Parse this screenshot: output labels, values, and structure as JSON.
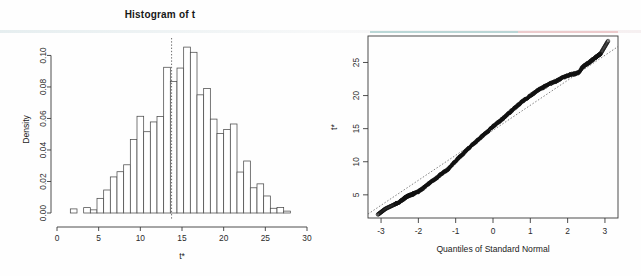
{
  "page": {
    "background": "#fefefe",
    "width": 641,
    "height": 276
  },
  "panels": {
    "histogram": {
      "title": "Histogram of t",
      "ylabel": "Density",
      "xlabel": "t*"
    },
    "qqplot": {
      "title": "",
      "ylabel": "t*",
      "xlabel": "Quantiles of Standard Normal"
    }
  },
  "colors": {
    "axis": "#3b3b3b",
    "bar_stroke": "#4a4a4a",
    "bar_fill": "#ffffff",
    "point": "#111111",
    "scan_teal": "#7fb8b5",
    "scan_pink": "#e2a3a6"
  },
  "chart_data": [
    {
      "type": "bar",
      "id": "histogram-of-t",
      "title": "Histogram of t",
      "xlabel": "t*",
      "ylabel": "Density",
      "xlim": [
        0,
        30
      ],
      "ylim": [
        0.0,
        0.106
      ],
      "xticks": [
        0,
        5,
        10,
        15,
        20,
        25,
        30
      ],
      "xtick_labels": [
        "0",
        "5",
        "10",
        "15",
        "20",
        "25",
        "30"
      ],
      "yticks": [
        0.0,
        0.02,
        0.04,
        0.06,
        0.08,
        0.1
      ],
      "ytick_labels": [
        "0.00",
        "0.02",
        "0.04",
        "0.06",
        "0.08",
        "0.10"
      ],
      "grid": false,
      "bin_width": 0.8,
      "bin_starts": [
        1.6,
        2.4,
        3.2,
        4.0,
        4.8,
        5.6,
        6.4,
        7.2,
        8.0,
        8.8,
        9.6,
        10.4,
        11.2,
        12.0,
        12.8,
        13.6,
        14.4,
        15.2,
        16.0,
        16.8,
        17.6,
        18.4,
        19.2,
        20.0,
        20.8,
        21.6,
        22.4,
        23.2,
        24.0,
        24.8,
        25.6,
        26.4,
        27.2,
        28.0
      ],
      "values": [
        0.0026,
        0.0,
        0.0034,
        0.002,
        0.0093,
        0.0146,
        0.0229,
        0.0262,
        0.0306,
        0.0466,
        0.0614,
        0.0516,
        0.0578,
        0.0612,
        0.0925,
        0.0835,
        0.092,
        0.1053,
        0.102,
        0.075,
        0.079,
        0.0596,
        0.0505,
        0.053,
        0.0565,
        0.026,
        0.033,
        0.016,
        0.0185,
        0.0108,
        0.003,
        0.0035,
        0.0012,
        0.0,
        0.0018
      ],
      "annotations": [
        {
          "type": "vertical-dashed-line",
          "x": 13.75,
          "label": "observed statistic"
        }
      ]
    },
    {
      "type": "scatter",
      "id": "normal-qq-plot",
      "title": "",
      "xlabel": "Quantiles of Standard Normal",
      "ylabel": "t*",
      "xlim": [
        -3.35,
        3.35
      ],
      "ylim": [
        1.5,
        29.0
      ],
      "xticks": [
        -3,
        -2,
        -1,
        0,
        1,
        2,
        3
      ],
      "xtick_labels": [
        "-3",
        "-2",
        "-1",
        "0",
        "1",
        "2",
        "3"
      ],
      "yticks": [
        5,
        10,
        15,
        20,
        25
      ],
      "ytick_labels": [
        "5",
        "10",
        "15",
        "20",
        "25"
      ],
      "grid": false,
      "frame": "box",
      "marker": "open-circle",
      "n_points": 1000,
      "reference_line": {
        "type": "qq-line",
        "x": [
          -3.35,
          3.35
        ],
        "y": [
          2.1,
          27.4
        ]
      },
      "points_xy": [
        [
          -3.09,
          2.0
        ],
        [
          -2.88,
          2.9
        ],
        [
          -2.62,
          3.6
        ],
        [
          -2.52,
          3.9
        ],
        [
          -2.45,
          4.1
        ],
        [
          -2.4,
          4.35
        ],
        [
          -2.35,
          4.6
        ],
        [
          -2.3,
          4.75
        ],
        [
          -2.25,
          4.9
        ],
        [
          -2.2,
          5.0
        ],
        [
          -2.15,
          5.1
        ],
        [
          -2.1,
          5.25
        ],
        [
          -2.0,
          5.5
        ],
        [
          -1.9,
          5.9
        ],
        [
          -1.8,
          6.3
        ],
        [
          -1.7,
          6.8
        ],
        [
          -1.6,
          7.2
        ],
        [
          -1.5,
          7.6
        ],
        [
          -1.4,
          8.1
        ],
        [
          -1.3,
          8.5
        ],
        [
          -1.2,
          8.9
        ],
        [
          -1.1,
          9.5
        ],
        [
          -1.0,
          10.1
        ],
        [
          -0.9,
          10.7
        ],
        [
          -0.8,
          11.2
        ],
        [
          -0.7,
          11.8
        ],
        [
          -0.6,
          12.3
        ],
        [
          -0.5,
          12.8
        ],
        [
          -0.4,
          13.3
        ],
        [
          -0.3,
          13.8
        ],
        [
          -0.2,
          14.3
        ],
        [
          -0.1,
          14.8
        ],
        [
          0.0,
          15.3
        ],
        [
          0.1,
          15.8
        ],
        [
          0.2,
          16.2
        ],
        [
          0.3,
          16.7
        ],
        [
          0.4,
          17.2
        ],
        [
          0.5,
          17.7
        ],
        [
          0.6,
          18.2
        ],
        [
          0.7,
          18.7
        ],
        [
          0.8,
          19.2
        ],
        [
          0.9,
          19.6
        ],
        [
          1.0,
          20.0
        ],
        [
          1.1,
          20.4
        ],
        [
          1.2,
          20.8
        ],
        [
          1.3,
          21.1
        ],
        [
          1.4,
          21.4
        ],
        [
          1.5,
          21.7
        ],
        [
          1.6,
          22.0
        ],
        [
          1.7,
          22.2
        ],
        [
          1.8,
          22.5
        ],
        [
          1.9,
          22.8
        ],
        [
          2.0,
          23.0
        ],
        [
          2.1,
          23.2
        ],
        [
          2.2,
          23.3
        ],
        [
          2.3,
          23.5
        ],
        [
          2.38,
          24.2
        ],
        [
          2.45,
          24.5
        ],
        [
          2.52,
          24.8
        ],
        [
          2.58,
          25.0
        ],
        [
          2.64,
          25.3
        ],
        [
          2.7,
          25.5
        ],
        [
          2.78,
          25.9
        ],
        [
          2.88,
          26.3
        ],
        [
          3.09,
          28.3
        ]
      ]
    }
  ]
}
